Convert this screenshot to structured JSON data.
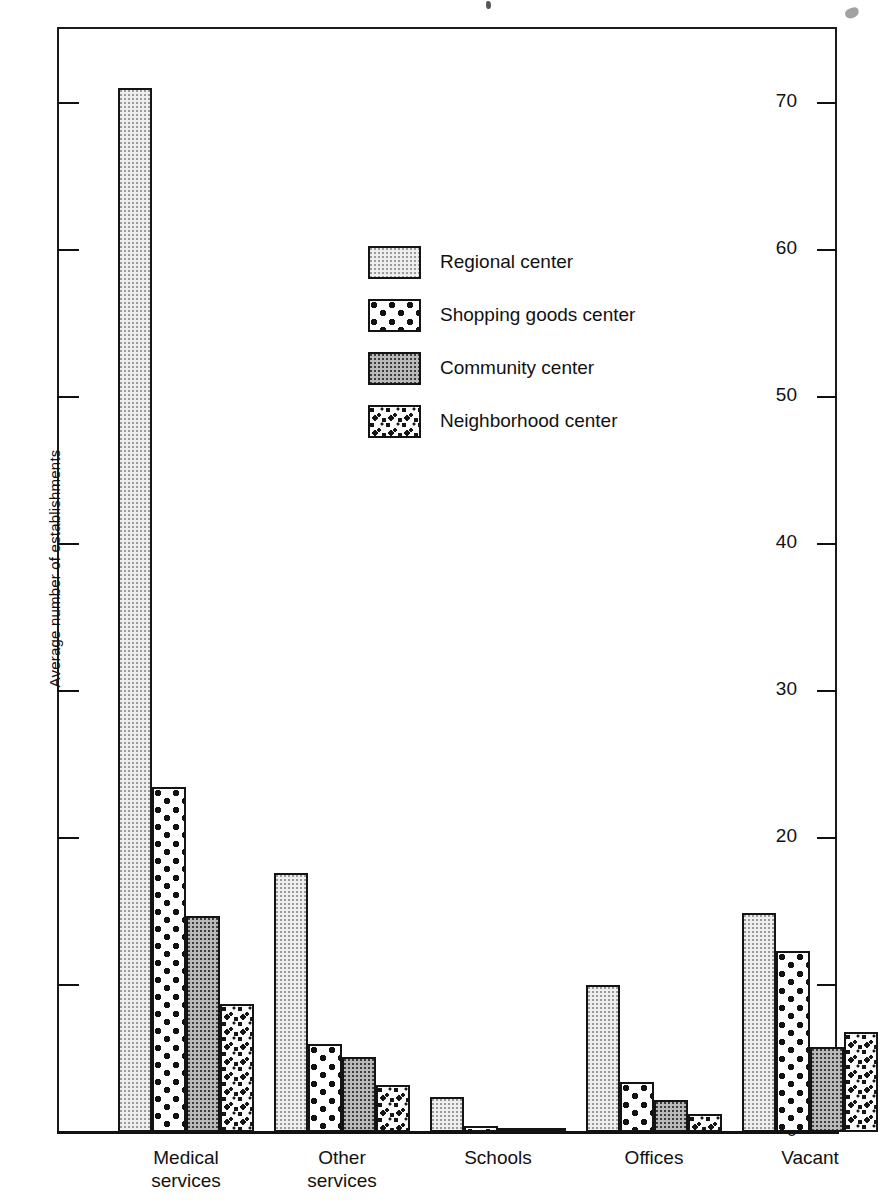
{
  "chart_data": {
    "type": "bar",
    "title": "",
    "xlabel": "",
    "ylabel": "Average number of establishments",
    "ylim": [
      0,
      75
    ],
    "yticks": [
      0,
      10,
      20,
      30,
      40,
      50,
      60,
      70
    ],
    "ytick_labels": [
      "0",
      "10",
      "20",
      "30",
      "40",
      "50",
      "60",
      "70"
    ],
    "grid": false,
    "legend_position": "upper-center",
    "categories": [
      "Medical services",
      "Other services",
      "Schools",
      "Offices",
      "Vacant"
    ],
    "series": [
      {
        "name": "Regional center",
        "pattern": "light-stipple",
        "values": [
          71.0,
          17.6,
          2.4,
          10.0,
          14.9
        ]
      },
      {
        "name": "Shopping goods center",
        "pattern": "bold-dots",
        "values": [
          23.5,
          6.0,
          0.4,
          3.4,
          12.3
        ]
      },
      {
        "name": "Community center",
        "pattern": "dense-grey",
        "values": [
          14.7,
          5.1,
          0.1,
          2.2,
          5.8
        ]
      },
      {
        "name": "Neighborhood center",
        "pattern": "coarse-speckle",
        "values": [
          8.7,
          3.2,
          0.3,
          1.2,
          6.8
        ]
      }
    ]
  },
  "axis": {
    "y_title": "Average number of establishments"
  },
  "legend": {
    "items": [
      {
        "label": "Regional center"
      },
      {
        "label": "Shopping goods center"
      },
      {
        "label": "Community center"
      },
      {
        "label": "Neighborhood center"
      }
    ]
  },
  "xaxis": {
    "labels": [
      "Medical\nservices",
      "Other\nservices",
      "Schools",
      "Offices",
      "Vacant"
    ]
  }
}
